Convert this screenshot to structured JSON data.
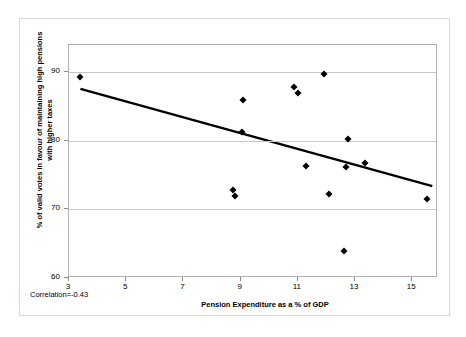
{
  "chart_data": {
    "type": "scatter",
    "title": "",
    "xlabel": "Pension Expenditure as a % of GDP",
    "ylabel": "% of valid votes in favour of maintaining high pensions with higher taxes",
    "xlim": [
      3,
      15.9
    ],
    "ylim": [
      60,
      94
    ],
    "xticks": [
      3,
      5,
      7,
      9,
      11,
      13,
      15
    ],
    "yticks": [
      60,
      70,
      80,
      90
    ],
    "grid": "horizontal",
    "legend": "none",
    "annotation": "Correlation=-0.43",
    "correlation": -0.43,
    "points": [
      {
        "x": 3.4,
        "y": 89.4
      },
      {
        "x": 8.75,
        "y": 72.9
      },
      {
        "x": 8.8,
        "y": 71.9
      },
      {
        "x": 9.05,
        "y": 81.3
      },
      {
        "x": 9.1,
        "y": 86.0
      },
      {
        "x": 10.85,
        "y": 87.8
      },
      {
        "x": 11.0,
        "y": 87.0
      },
      {
        "x": 11.3,
        "y": 76.4
      },
      {
        "x": 11.9,
        "y": 89.7
      },
      {
        "x": 12.1,
        "y": 72.3
      },
      {
        "x": 12.6,
        "y": 63.9
      },
      {
        "x": 12.75,
        "y": 80.3
      },
      {
        "x": 12.7,
        "y": 76.2
      },
      {
        "x": 13.35,
        "y": 76.8
      },
      {
        "x": 15.5,
        "y": 71.6
      }
    ],
    "trendline": {
      "x1": 3.4,
      "y1": 87.6,
      "x2": 15.7,
      "y2": 73.4,
      "color": "#000000",
      "width": 2.4
    },
    "marker": {
      "shape": "diamond",
      "color": "#000000",
      "size": 5
    }
  }
}
